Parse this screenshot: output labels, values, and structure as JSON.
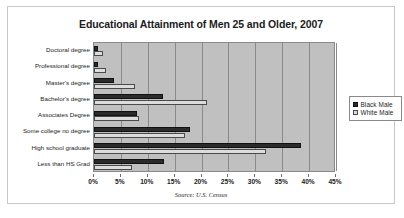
{
  "chart_data": {
    "type": "bar",
    "orientation": "horizontal",
    "title": "Educational Attainment of Men 25 and Older, 2007",
    "xlabel": "",
    "ylabel": "",
    "xlim": [
      0,
      45
    ],
    "xtick_labels": [
      "0%",
      "5%",
      "10%",
      "15%",
      "20%",
      "25%",
      "30%",
      "35%",
      "40%",
      "45%"
    ],
    "xtick_values": [
      0,
      5,
      10,
      15,
      20,
      25,
      30,
      35,
      40,
      45
    ],
    "grid": true,
    "legend_position": "right",
    "categories": [
      "Doctoral degree",
      "Professional degree",
      "Master's degree",
      "Bachelor's degree",
      "Associates Degree",
      "Some college no degree",
      "High school graduate",
      "Less than HS Grad"
    ],
    "series": [
      {
        "name": "Black Male",
        "color": "#2b2b2b",
        "values": [
          0.7,
          0.8,
          3.8,
          12.8,
          8.0,
          17.8,
          38.5,
          13.0
        ]
      },
      {
        "name": "White Male",
        "color": "#dcdcdc",
        "values": [
          1.7,
          2.3,
          7.7,
          21.0,
          8.3,
          17.0,
          32.0,
          7.0
        ]
      }
    ],
    "annotation": "Source:  U.S. Census"
  },
  "legend": {
    "items": [
      {
        "label": "Black Male",
        "swatch": "black-swatch-icon"
      },
      {
        "label": "White Male",
        "swatch": "white-swatch-icon"
      }
    ]
  }
}
